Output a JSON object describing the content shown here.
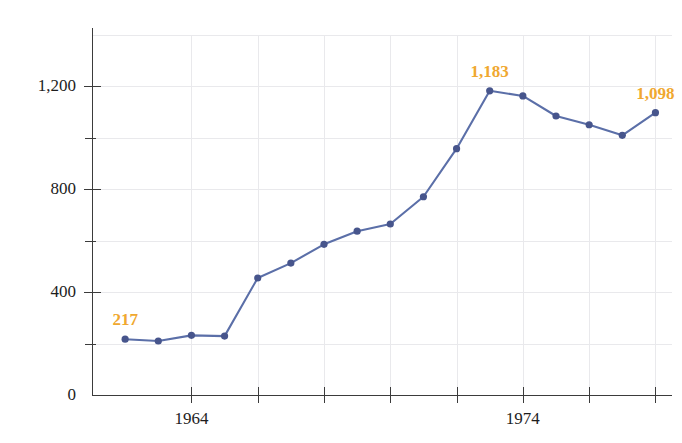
{
  "chart_data": {
    "type": "line",
    "title": "",
    "subtitle": "",
    "xlabel": "",
    "ylabel": "",
    "grid": true,
    "legend": null,
    "xlim": [
      1961,
      1978.5
    ],
    "ylim": [
      0,
      1400
    ],
    "x": [
      1962,
      1963,
      1964,
      1965,
      1966,
      1967,
      1968,
      1969,
      1970,
      1971,
      1972,
      1973,
      1974,
      1975,
      1976,
      1977,
      1978,
      1979
    ],
    "values": [
      217,
      210,
      232,
      229,
      455,
      513,
      586,
      637,
      665,
      771,
      958,
      1183,
      1183,
      1163,
      1085,
      1051,
      1010,
      1098
    ],
    "series": [
      {
        "name": "series-1",
        "color": "#5B6FA8",
        "points": [
          {
            "x": 1962,
            "y": 217
          },
          {
            "x": 1963,
            "y": 210
          },
          {
            "x": 1964,
            "y": 232
          },
          {
            "x": 1965,
            "y": 229
          },
          {
            "x": 1966,
            "y": 455
          },
          {
            "x": 1967,
            "y": 513
          },
          {
            "x": 1968,
            "y": 586
          },
          {
            "x": 1969,
            "y": 637
          },
          {
            "x": 1970,
            "y": 665
          },
          {
            "x": 1971,
            "y": 771
          },
          {
            "x": 1972,
            "y": 958
          },
          {
            "x": 1973,
            "y": 1183
          },
          {
            "x": 1974,
            "y": 1163
          },
          {
            "x": 1975,
            "y": 1085
          },
          {
            "x": 1976,
            "y": 1051
          },
          {
            "x": 1977,
            "y": 1010
          },
          {
            "x": 1978,
            "y": 1098
          }
        ]
      }
    ],
    "y_ticks_major": [
      "0",
      "400",
      "800",
      "1,200"
    ],
    "y_tick_values": [
      0,
      400,
      800,
      1200
    ],
    "y_minor_values": [
      200,
      600,
      1000
    ],
    "x_tick_values": [
      1964,
      1966,
      1968,
      1970,
      1972,
      1974,
      1976,
      1978
    ],
    "x_tick_labels": [
      "1964",
      "",
      "",
      "",
      "",
      "1974",
      "",
      ""
    ],
    "annotations": [
      {
        "text": "217",
        "value": 217,
        "x": 1962,
        "color": "#F0A830"
      },
      {
        "text": "1,183",
        "value": 1183,
        "x": 1973,
        "color": "#F0A830"
      },
      {
        "text": "1,098",
        "value": 1098,
        "x": 1978,
        "color": "#F0A830"
      }
    ],
    "colors": {
      "line": "#5B6FA8",
      "marker": "#47558C",
      "annotation": "#F0A830",
      "grid": "#e9e9ec",
      "axis": "#3b3b3b",
      "background": "#ffffff"
    }
  }
}
